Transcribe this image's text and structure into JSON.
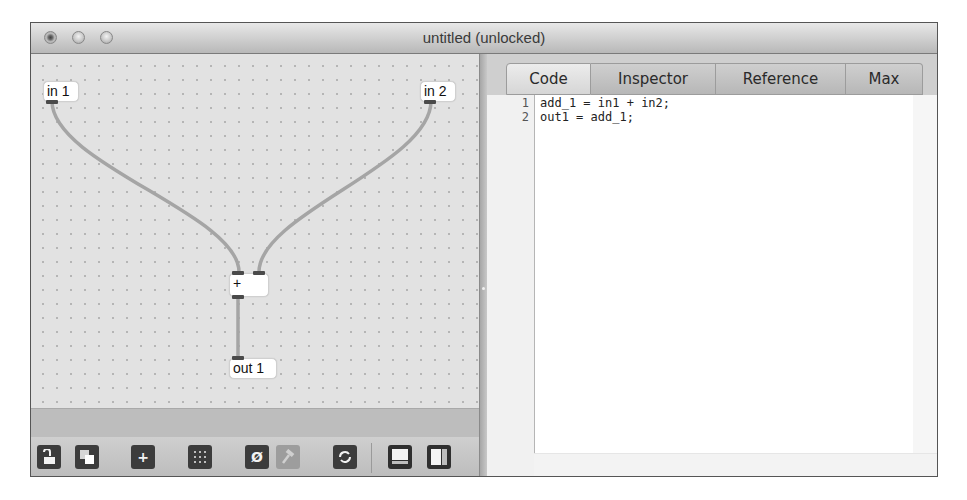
{
  "window": {
    "title": "untitled (unlocked)",
    "controls": [
      "close",
      "minimize",
      "zoom"
    ]
  },
  "patcher": {
    "objects": [
      {
        "id": "in1",
        "label": "in 1",
        "type": "inlet"
      },
      {
        "id": "in2",
        "label": "in 2",
        "type": "inlet"
      },
      {
        "id": "add",
        "label": "+",
        "type": "operator"
      },
      {
        "id": "out1",
        "label": "out 1",
        "type": "outlet"
      }
    ],
    "connections": [
      {
        "from": "in 1",
        "to": "+ (left inlet)"
      },
      {
        "from": "in 2",
        "to": "+ (right inlet)"
      },
      {
        "from": "+",
        "to": "out 1"
      }
    ],
    "cable_color": "#a9a9a9"
  },
  "toolbar": {
    "buttons": [
      {
        "name": "lock",
        "icon": "unlock-icon"
      },
      {
        "name": "presentation",
        "icon": "presentation-icon"
      },
      {
        "name": "new-object",
        "icon": "plus-icon",
        "glyph": "+"
      },
      {
        "name": "grid",
        "icon": "grid-icon"
      },
      {
        "name": "clear",
        "icon": "null-icon",
        "glyph": "Ø"
      },
      {
        "name": "debug",
        "icon": "hammer-icon",
        "disabled": true
      },
      {
        "name": "refresh",
        "icon": "refresh-icon"
      },
      {
        "name": "bottom-panel",
        "icon": "bottom-panel-icon"
      },
      {
        "name": "side-panel",
        "icon": "side-panel-icon"
      }
    ]
  },
  "sidebar": {
    "tabs": [
      {
        "label": "Code",
        "selected": true
      },
      {
        "label": "Inspector",
        "selected": false
      },
      {
        "label": "Reference",
        "selected": false
      },
      {
        "label": "Max",
        "selected": false
      }
    ],
    "code": {
      "lines": [
        {
          "num": "1",
          "text": "add_1 = in1 + in2;"
        },
        {
          "num": "2",
          "text": "out1 = add_1;"
        }
      ]
    }
  }
}
